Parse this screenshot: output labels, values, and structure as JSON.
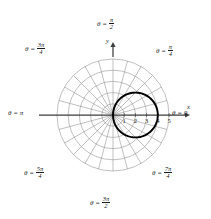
{
  "figure": {
    "type": "polar-plot",
    "axis_labels": {
      "x": "x",
      "y": "y"
    },
    "radial_ticks": [
      "1",
      "2",
      "3",
      "4",
      "5"
    ],
    "angle_labels": [
      {
        "name": "theta-0",
        "prefix": "θ =",
        "value": "0",
        "is_fraction": false,
        "numerator": "",
        "denominator": ""
      },
      {
        "name": "theta-pi-4",
        "prefix": "θ =",
        "value": "",
        "is_fraction": true,
        "numerator": "π",
        "denominator": "4"
      },
      {
        "name": "theta-pi-2",
        "prefix": "θ =",
        "value": "",
        "is_fraction": true,
        "numerator": "π",
        "denominator": "2"
      },
      {
        "name": "theta-3pi-4",
        "prefix": "θ =",
        "value": "",
        "is_fraction": true,
        "numerator": "3π",
        "denominator": "4"
      },
      {
        "name": "theta-pi",
        "prefix": "θ =",
        "value": "π",
        "is_fraction": false,
        "numerator": "",
        "denominator": ""
      },
      {
        "name": "theta-5pi-4",
        "prefix": "θ =",
        "value": "",
        "is_fraction": true,
        "numerator": "5π",
        "denominator": "4"
      },
      {
        "name": "theta-3pi-2",
        "prefix": "θ =",
        "value": "",
        "is_fraction": true,
        "numerator": "3π",
        "denominator": "2"
      },
      {
        "name": "theta-7pi-4",
        "prefix": "θ =",
        "value": "",
        "is_fraction": true,
        "numerator": "7π",
        "denominator": "4"
      }
    ],
    "colors": {
      "grid": "#8c8c8c",
      "axis": "#3d3d3d",
      "curve": "#000000",
      "text": "#1a1a1a",
      "background": "#ffffff"
    }
  },
  "chart_data": {
    "type": "line",
    "plot_kind": "polar",
    "title": "",
    "xlabel": "x",
    "ylabel": "y",
    "grid": true,
    "legend": null,
    "pole": {
      "x": 113,
      "y": 115
    },
    "unit_px": 11.2,
    "radial_axis": {
      "ticks": [
        1,
        2,
        3,
        4,
        5
      ],
      "rmax": 5,
      "gridline_radii": [
        1,
        2,
        3,
        4,
        5
      ]
    },
    "angular_axis": {
      "spoke_step_deg": 15,
      "spoke_count": 24,
      "labeled_angles_deg": [
        0,
        45,
        90,
        135,
        180,
        225,
        270,
        315
      ],
      "labeled_angles_text": [
        "0",
        "π/4",
        "π/2",
        "3π/4",
        "π",
        "5π/4",
        "3π/2",
        "7π/4"
      ]
    },
    "series": [
      {
        "name": "r = 4 cos(theta)",
        "equation": "r = 4cosθ",
        "shape": "circle through pole",
        "circle_center": [
          2,
          0
        ],
        "circle_radius": 2,
        "r_max": 4,
        "theta_start_deg": -80,
        "theta_end_deg": 262,
        "has_gap": true,
        "gap_near": [
          4,
          0
        ],
        "r_values_deg": [
          {
            "theta": 0,
            "r": 4.0
          },
          {
            "theta": 15,
            "r": 3.86
          },
          {
            "theta": 30,
            "r": 3.46
          },
          {
            "theta": 45,
            "r": 2.83
          },
          {
            "theta": 60,
            "r": 2.0
          },
          {
            "theta": 75,
            "r": 1.04
          },
          {
            "theta": 90,
            "r": 0.0
          },
          {
            "theta": 105,
            "r": 1.04
          },
          {
            "theta": 120,
            "r": 2.0
          },
          {
            "theta": 135,
            "r": 2.83
          },
          {
            "theta": 150,
            "r": 3.46
          },
          {
            "theta": 165,
            "r": 3.86
          },
          {
            "theta": 180,
            "r": 4.0
          }
        ]
      }
    ]
  }
}
